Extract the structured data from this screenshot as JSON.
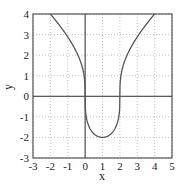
{
  "chart_data": {
    "type": "line",
    "title": "",
    "xlabel": "x",
    "ylabel": "y",
    "xlim": [
      -3,
      5
    ],
    "ylim": [
      -3,
      4
    ],
    "xticks": [
      -3,
      -2,
      -1,
      0,
      1,
      2,
      3,
      4,
      5
    ],
    "yticks": [
      -3,
      -2,
      -1,
      0,
      1,
      2,
      3,
      4
    ],
    "xtick_labels": [
      "-3",
      "-2",
      "-1",
      "0",
      "1",
      "2",
      "3",
      "4",
      "5"
    ],
    "ytick_labels": [
      "-3",
      "-2",
      "-1",
      "0",
      "1",
      "2",
      "3",
      "4"
    ],
    "grid": true,
    "grid_style": "dotted",
    "axes_lines_through_origin": true,
    "series": [
      {
        "name": "y = 2*cbrt(x^2 - 2x)",
        "x": [
          -2,
          -1.5,
          -1,
          -0.5,
          -0.1,
          0,
          0.1,
          0.5,
          1,
          1.5,
          1.9,
          2,
          2.1,
          2.5,
          3,
          3.5,
          4
        ],
        "y": [
          4,
          3.6,
          2.88,
          2.16,
          1.19,
          0,
          -1.15,
          -1.82,
          -2,
          -1.82,
          -1.15,
          0,
          1.19,
          2.16,
          2.88,
          3.6,
          4
        ]
      }
    ],
    "colors": {
      "curve": "#555555",
      "axes": "#333333",
      "grid": "#999999"
    }
  }
}
